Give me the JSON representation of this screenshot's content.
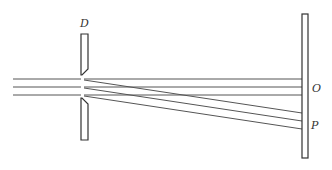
{
  "diagram": {
    "type": "physics-apparatus",
    "labels": {
      "slit": "D",
      "center_point": "O",
      "deflected_point": "P"
    },
    "components": [
      {
        "name": "slit-plate",
        "label": "D",
        "description": "Aperture plate with narrow slit"
      },
      {
        "name": "screen",
        "description": "Vertical detection screen"
      }
    ],
    "beams": {
      "incoming_count": 3,
      "undeflected_count": 3,
      "deflected_count": 3,
      "undeflected_target": "O",
      "deflected_target": "P"
    },
    "colors": {
      "line": "#555555",
      "outline": "#333333",
      "background": "#ffffff"
    }
  }
}
